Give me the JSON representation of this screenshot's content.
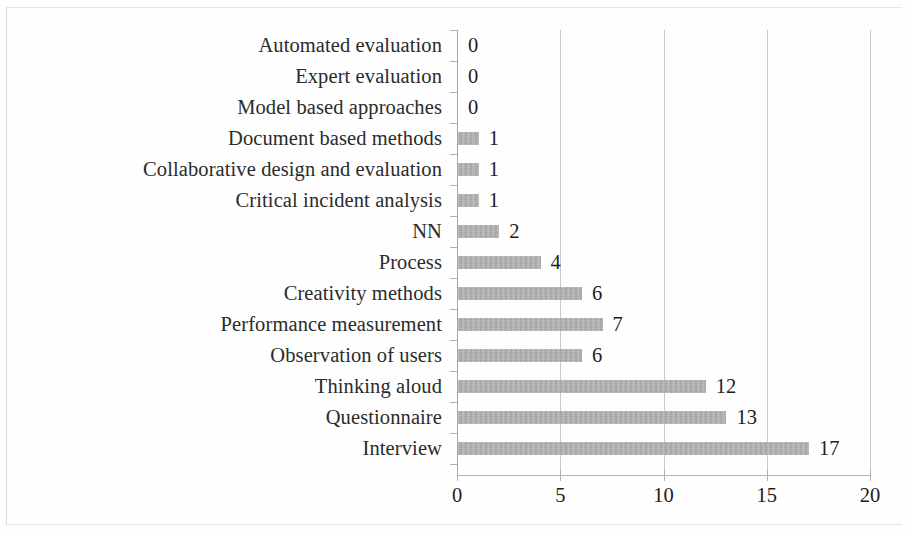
{
  "chart_data": {
    "type": "bar",
    "orientation": "horizontal",
    "title": "",
    "xlabel": "",
    "ylabel": "",
    "xlim": [
      0,
      20
    ],
    "xticks": [
      0,
      5,
      10,
      15,
      20
    ],
    "xtick_labels": [
      "0",
      "5",
      "10",
      "15",
      "20"
    ],
    "grid": "vertical",
    "legend": "none",
    "bar_color": "#a9a9a9",
    "text_color": "#231f20",
    "gridline_color": "#c9c9c9",
    "axis_color": "#b0b0b0",
    "show_value_labels": true,
    "categories": [
      "Automated evaluation",
      "Expert evaluation",
      "Model based approaches",
      "Document based methods",
      "Collaborative design and evaluation",
      "Critical incident analysis",
      "NN",
      "Process",
      "Creativity methods",
      "Performance measurement",
      "Observation of users",
      "Thinking aloud",
      "Questionnaire",
      "Interview"
    ],
    "values": [
      0,
      0,
      0,
      1,
      1,
      1,
      2,
      4,
      6,
      7,
      6,
      12,
      13,
      17
    ],
    "value_labels": [
      "0",
      "0",
      "0",
      "1",
      "1",
      "1",
      "2",
      "4",
      "6",
      "7",
      "6",
      "12",
      "13",
      "17"
    ]
  }
}
